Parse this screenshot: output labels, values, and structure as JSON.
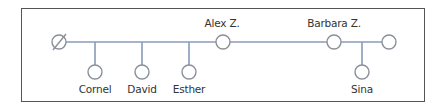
{
  "diagram": {
    "type": "family-tree",
    "line_color": "#8a9bb8",
    "border_color": "#555555",
    "nodes": [
      {
        "id": "deceased",
        "label": "",
        "symbol": "empty-set-circle"
      },
      {
        "id": "cornel",
        "label": "Cornel"
      },
      {
        "id": "david",
        "label": "David"
      },
      {
        "id": "esther",
        "label": "Esther"
      },
      {
        "id": "alex",
        "label": "Alex Z."
      },
      {
        "id": "barbara",
        "label": "Barbara Z."
      },
      {
        "id": "partner",
        "label": ""
      },
      {
        "id": "sina",
        "label": "Sina"
      }
    ],
    "edges": [
      {
        "from": "deceased",
        "to": "alex",
        "kind": "partnership"
      },
      {
        "from": "deceased-alex",
        "to": "cornel",
        "kind": "child"
      },
      {
        "from": "deceased-alex",
        "to": "david",
        "kind": "child"
      },
      {
        "from": "deceased-alex",
        "to": "esther",
        "kind": "child"
      },
      {
        "from": "alex",
        "to": "barbara",
        "kind": "sibling-line"
      },
      {
        "from": "barbara",
        "to": "partner",
        "kind": "partnership"
      },
      {
        "from": "barbara-partner",
        "to": "sina",
        "kind": "child"
      }
    ]
  },
  "labels": {
    "cornel": "Cornel",
    "david": "David",
    "esther": "Esther",
    "alex": "Alex Z.",
    "barbara": "Barbara Z.",
    "sina": "Sina"
  }
}
